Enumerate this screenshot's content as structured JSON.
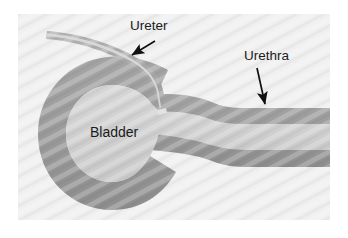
{
  "figure": {
    "panel": {
      "background_color": "#f0f0f0",
      "border_color": "#e6e6e6"
    },
    "colors": {
      "page_background": "#ffffff",
      "wall_fill": "#9b9b9b",
      "wall_fill_dark": "#8f8f8f",
      "lumen_fill": "#cfcfcf",
      "ureter_wall": "#a8a8a8",
      "ureter_lumen": "#d8d8d8",
      "label_text": "#1b1b1b",
      "arrow_color": "#111111",
      "texture_color": "#e3e3e3"
    }
  },
  "labels": [
    {
      "id": "ureter",
      "text": "Ureter",
      "x": 130,
      "y": 30,
      "anchor": "start",
      "arrow": {
        "from_x": 155,
        "from_y": 41,
        "to_x": 130,
        "to_y": 56,
        "direction": "down-left"
      }
    },
    {
      "id": "urethra",
      "text": "Urethra",
      "x": 244,
      "y": 60,
      "anchor": "start",
      "arrow": {
        "from_x": 258,
        "from_y": 67,
        "to_x": 266,
        "to_y": 107,
        "direction": "down"
      }
    },
    {
      "id": "bladder",
      "text": "Bladder",
      "x": 90,
      "y": 137,
      "anchor": "start",
      "arrow": null
    }
  ],
  "structures": [
    {
      "id": "bladder-body",
      "name": "bladder",
      "description": "Large rounded sac on the left with a thick gray wall and a lighter interior lumen"
    },
    {
      "id": "ureter-tube",
      "name": "ureter",
      "description": "Thin curved tube entering from the upper left, descending through the bladder wall and opening inside the bladder"
    },
    {
      "id": "urethra-tube",
      "name": "urethra",
      "description": "Horizontal tube leaving the bladder on the right and running to the right edge of the panel"
    }
  ]
}
